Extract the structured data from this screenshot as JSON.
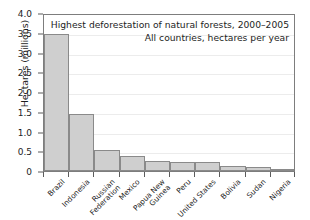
{
  "chart_data": {
    "type": "bar",
    "title": "Highest deforestation of natural forests, 2000–2005",
    "subtitle": "All countries, hectares per year",
    "xlabel": "",
    "ylabel": "Hectares (millions)",
    "ylim": [
      0,
      4.0
    ],
    "ytick_labels": [
      "0",
      "0.5",
      "1.0",
      "1.5",
      "2.0",
      "2.5",
      "3.0",
      "3.5",
      "4.0"
    ],
    "ytick_values": [
      0,
      0.5,
      1.0,
      1.5,
      2.0,
      2.5,
      3.0,
      3.5,
      4.0
    ],
    "grid": true,
    "legend": null,
    "bar_color": "#cfcfcf",
    "bar_border_color": "#8a8a8a",
    "axis_color": "#7d7d7d",
    "categories": [
      "Brazil",
      "Indonesia",
      "Russian\nFederation",
      "Mexico",
      "Papua New\nGuinea",
      "Peru",
      "United States",
      "Bolivia",
      "Sudan",
      "Nigeria"
    ],
    "values": [
      3.47,
      1.45,
      0.53,
      0.39,
      0.25,
      0.22,
      0.22,
      0.13,
      0.11,
      0.06
    ]
  }
}
